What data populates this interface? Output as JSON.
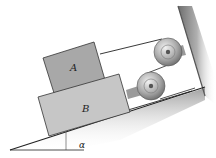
{
  "figure": {
    "type": "physics-diagram",
    "labels": {
      "block_a": "A",
      "block_b": "B",
      "angle": "α"
    },
    "colors": {
      "block_a": "#a9a9a9",
      "block_b": "#c4c4c4",
      "incline_shadow": "#8a8a8a",
      "wall": "#7a7a7a",
      "pulley": "#b8b8b8",
      "cord": "#333333"
    }
  }
}
